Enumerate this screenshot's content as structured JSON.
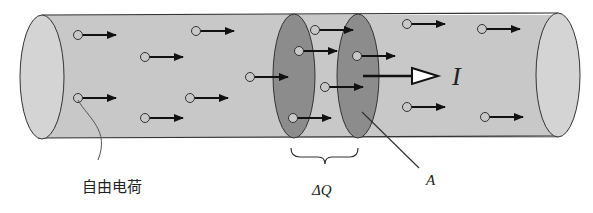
{
  "diagram": {
    "colors": {
      "tube_fill": "#c8c8c8",
      "tube_end": "#d4d4d4",
      "section_fill": "#8c8c8c",
      "outline": "#333333",
      "arrow": "#111111",
      "charge_fill": "#c8c8c8"
    },
    "labels": {
      "free_charge": "自由电荷",
      "delta_q": "ΔQ",
      "area": "A",
      "current": "I"
    },
    "charges": [
      {
        "x": 78,
        "y": 35
      },
      {
        "x": 145,
        "y": 57
      },
      {
        "x": 196,
        "y": 31
      },
      {
        "x": 250,
        "y": 77
      },
      {
        "x": 78,
        "y": 98
      },
      {
        "x": 190,
        "y": 98
      },
      {
        "x": 145,
        "y": 118
      },
      {
        "x": 315,
        "y": 30
      },
      {
        "x": 299,
        "y": 51
      },
      {
        "x": 357,
        "y": 56
      },
      {
        "x": 325,
        "y": 87
      },
      {
        "x": 293,
        "y": 118
      },
      {
        "x": 407,
        "y": 24
      },
      {
        "x": 482,
        "y": 29
      },
      {
        "x": 407,
        "y": 107
      },
      {
        "x": 485,
        "y": 117
      }
    ]
  }
}
